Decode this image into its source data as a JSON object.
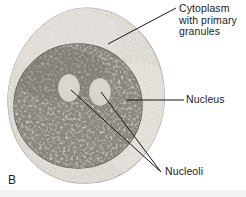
{
  "figure": {
    "panel_letter": "B",
    "background_color": "#ffffff"
  },
  "labels": [
    {
      "key": "cytoplasm",
      "text": "Cytoplasm\nwith primary\ngranules",
      "lines": [
        "Cytoplasm",
        "with primary",
        "granules"
      ],
      "leader": {
        "x1": 176,
        "y1": 8,
        "x2": 108,
        "y2": 44
      }
    },
    {
      "key": "nucleus",
      "text": "Nucleus",
      "lines": [
        "Nucleus"
      ],
      "leader": {
        "x1": 184,
        "y1": 100,
        "x2": 126,
        "y2": 100
      }
    },
    {
      "key": "nucleoli",
      "text": "Nucleoli",
      "lines": [
        "Nucleoli"
      ],
      "leader_a": {
        "x1": 161,
        "y1": 172,
        "x2": 71,
        "y2": 90
      },
      "leader_b": {
        "x1": 161,
        "y1": 172,
        "x2": 101,
        "y2": 92
      }
    }
  ],
  "structures": {
    "cell": {
      "name": "cell-body",
      "center": {
        "cx": 86,
        "cy": 95
      },
      "radius": {
        "rx": 79,
        "ry": 88
      },
      "fill_color": "#cfcbc4",
      "edge_color": "#b0aca5"
    },
    "cytoplasm": {
      "name": "cytoplasm",
      "fill_color": "#d8d4cd",
      "granule_color": "#f1eee9",
      "granule_count": 520,
      "description": "pale granular rim surrounding nucleus"
    },
    "nucleus": {
      "name": "nucleus",
      "center": {
        "cx": 78,
        "cy": 106
      },
      "radius": {
        "rx": 64,
        "ry": 62
      },
      "fill_color": "#8b8880",
      "edge_color": "#6e6b64",
      "chromatin_color": "#d6d2cb",
      "chromatin_count": 900
    },
    "nucleoli": [
      {
        "name": "nucleolus-left",
        "center": {
          "cx": 69,
          "cy": 88
        },
        "radius": {
          "rx": 11,
          "ry": 14
        },
        "fill_color": "#d9d5ce",
        "edge_color": "#6f6c66"
      },
      {
        "name": "nucleolus-right",
        "center": {
          "cx": 100,
          "cy": 92
        },
        "radius": {
          "rx": 11,
          "ry": 14
        },
        "fill_color": "#d9d5ce",
        "edge_color": "#6f6c66"
      }
    ]
  },
  "colors": {
    "leader_line": "#161616",
    "text": "#1b1b1b",
    "page_background": "#ffffff",
    "bottom_band": "#f3f3f3"
  }
}
